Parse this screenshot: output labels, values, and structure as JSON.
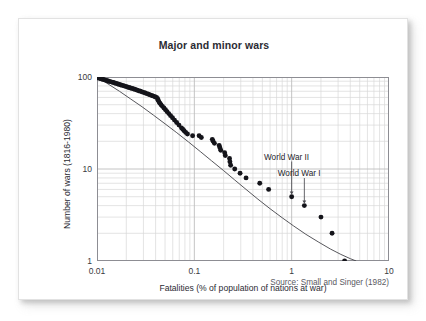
{
  "card": {
    "background": "#ffffff",
    "border_color": "#e2e2e2"
  },
  "source": {
    "text": "Source: Small and Singer (1982)"
  },
  "annotations": [
    {
      "label": "World War II",
      "x": 1.0,
      "y": 5.0,
      "label_x": 0.52,
      "label_y": 13.0
    },
    {
      "label": "World War I",
      "x": 1.35,
      "y": 4.0,
      "label_x": 0.72,
      "label_y": 8.6
    }
  ],
  "chart_data": {
    "type": "scatter",
    "title": "Major and minor wars",
    "xlabel": "Fatalities (% of population of nations at war)",
    "ylabel": "Number of wars (1816-1980)",
    "xscale": "log",
    "yscale": "log",
    "xlim": [
      0.01,
      10
    ],
    "ylim": [
      1,
      100
    ],
    "xticks": [
      0.01,
      0.1,
      1,
      10
    ],
    "xtick_labels": [
      "0.01",
      "0.1",
      "1",
      "10"
    ],
    "yticks": [
      1,
      10,
      100
    ],
    "ytick_labels": [
      "1",
      "10",
      "100"
    ],
    "grid": true,
    "grid_minor": true,
    "grid_color": "#d9d9d9",
    "grid_major_color": "#bdbdbd",
    "legend": "none",
    "marker_color": "#14141a",
    "fit_line_color": "#44444a",
    "annotation_count": 2,
    "series": [
      {
        "name": "Wars (cumulative count vs fatalities)",
        "marker": "filled-circle",
        "points": [
          [
            0.01,
            99
          ],
          [
            0.0103,
            98
          ],
          [
            0.0106,
            97
          ],
          [
            0.0109,
            96
          ],
          [
            0.0112,
            95
          ],
          [
            0.0116,
            94
          ],
          [
            0.012,
            93
          ],
          [
            0.0124,
            92
          ],
          [
            0.0128,
            91
          ],
          [
            0.0132,
            90
          ],
          [
            0.0137,
            89
          ],
          [
            0.0142,
            88
          ],
          [
            0.0147,
            87
          ],
          [
            0.0152,
            86
          ],
          [
            0.0158,
            85
          ],
          [
            0.0164,
            84
          ],
          [
            0.017,
            83
          ],
          [
            0.0176,
            82
          ],
          [
            0.0183,
            81
          ],
          [
            0.019,
            80
          ],
          [
            0.0197,
            79
          ],
          [
            0.0205,
            78
          ],
          [
            0.0213,
            77
          ],
          [
            0.0221,
            76
          ],
          [
            0.023,
            75
          ],
          [
            0.0239,
            74
          ],
          [
            0.0248,
            73
          ],
          [
            0.0258,
            72
          ],
          [
            0.0268,
            71
          ],
          [
            0.0279,
            70
          ],
          [
            0.029,
            69
          ],
          [
            0.0301,
            68
          ],
          [
            0.0313,
            67
          ],
          [
            0.0325,
            66
          ],
          [
            0.0338,
            65
          ],
          [
            0.0351,
            64
          ],
          [
            0.0365,
            63
          ],
          [
            0.0379,
            62
          ],
          [
            0.0394,
            61
          ],
          [
            0.0409,
            60
          ],
          [
            0.042,
            58
          ],
          [
            0.0425,
            56
          ],
          [
            0.0432,
            54
          ],
          [
            0.0442,
            52
          ],
          [
            0.0455,
            50
          ],
          [
            0.047,
            48
          ],
          [
            0.0487,
            46
          ],
          [
            0.0505,
            44
          ],
          [
            0.0525,
            42
          ],
          [
            0.0546,
            40
          ],
          [
            0.057,
            38
          ],
          [
            0.0596,
            36
          ],
          [
            0.0625,
            34
          ],
          [
            0.0658,
            32
          ],
          [
            0.0695,
            30
          ],
          [
            0.0737,
            28
          ],
          [
            0.076,
            27
          ],
          [
            0.0785,
            26
          ],
          [
            0.0815,
            25
          ],
          [
            0.085,
            24
          ],
          [
            0.096,
            23
          ],
          [
            0.112,
            23
          ],
          [
            0.118,
            22
          ],
          [
            0.153,
            21
          ],
          [
            0.156,
            20
          ],
          [
            0.161,
            19
          ],
          [
            0.18,
            18
          ],
          [
            0.183,
            17
          ],
          [
            0.187,
            16
          ],
          [
            0.205,
            15
          ],
          [
            0.208,
            14
          ],
          [
            0.23,
            13
          ],
          [
            0.232,
            12
          ],
          [
            0.236,
            11
          ],
          [
            0.26,
            10
          ],
          [
            0.295,
            9
          ],
          [
            0.34,
            8
          ],
          [
            0.47,
            7
          ],
          [
            0.58,
            6
          ],
          [
            1.0,
            5
          ],
          [
            1.35,
            4
          ],
          [
            2.0,
            3
          ],
          [
            2.6,
            2
          ],
          [
            3.5,
            1
          ]
        ]
      }
    ],
    "fit_line": {
      "name": "fitted power-law / curved fit",
      "points": [
        [
          0.01,
          100.0
        ],
        [
          0.013,
          84.0
        ],
        [
          0.017,
          70.0
        ],
        [
          0.022,
          58.0
        ],
        [
          0.029,
          47.5
        ],
        [
          0.038,
          38.5
        ],
        [
          0.05,
          31.0
        ],
        [
          0.066,
          24.8
        ],
        [
          0.087,
          19.7
        ],
        [
          0.115,
          15.5
        ],
        [
          0.15,
          12.3
        ],
        [
          0.2,
          9.6
        ],
        [
          0.26,
          7.6
        ],
        [
          0.34,
          6.0
        ],
        [
          0.45,
          4.7
        ],
        [
          0.6,
          3.7
        ],
        [
          0.8,
          2.95
        ],
        [
          1.05,
          2.4
        ],
        [
          1.4,
          1.95
        ],
        [
          1.9,
          1.6
        ],
        [
          2.5,
          1.35
        ],
        [
          3.2,
          1.18
        ],
        [
          4.0,
          1.06
        ],
        [
          4.6,
          1.0
        ]
      ]
    }
  }
}
